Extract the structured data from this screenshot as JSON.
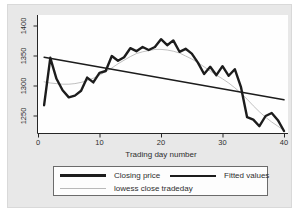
{
  "chart_data": {
    "type": "line",
    "title": "",
    "xlabel": "Trading day number",
    "ylabel": "",
    "xlim": [
      0,
      41
    ],
    "ylim": [
      1221,
      1405
    ],
    "grid": false,
    "legend_position": "bottom",
    "x_tick_values": [
      0,
      10,
      20,
      30,
      40
    ],
    "y_tick_values": [
      1250,
      1300,
      1350,
      1400
    ],
    "x": [
      1,
      2,
      3,
      4,
      5,
      6,
      7,
      8,
      9,
      10,
      11,
      12,
      13,
      14,
      15,
      16,
      17,
      18,
      19,
      20,
      21,
      22,
      23,
      24,
      25,
      26,
      27,
      28,
      29,
      30,
      31,
      32,
      33,
      34,
      35,
      36,
      37,
      38,
      39,
      40
    ],
    "series": [
      {
        "name": "Closing price",
        "style": "thick-solid-black",
        "values": [
          1268,
          1347,
          1312,
          1293,
          1281,
          1284,
          1292,
          1314,
          1306,
          1322,
          1325,
          1350,
          1342,
          1348,
          1363,
          1358,
          1365,
          1360,
          1365,
          1378,
          1368,
          1376,
          1357,
          1362,
          1354,
          1339,
          1320,
          1332,
          1318,
          1333,
          1317,
          1328,
          1298,
          1248,
          1244,
          1233,
          1250,
          1255,
          1243,
          1225
        ]
      },
      {
        "name": "Fitted values",
        "style": "medium-solid-black",
        "x": [
          1,
          40
        ],
        "values": [
          1348,
          1277
        ]
      },
      {
        "name": "lowess close tradeday",
        "style": "thin-solid-gray",
        "values": [
          1307,
          1305,
          1304,
          1303,
          1303,
          1304,
          1306,
          1309,
          1313,
          1318,
          1324,
          1330,
          1337,
          1343,
          1349,
          1354,
          1357,
          1359,
          1361,
          1361,
          1360,
          1358,
          1355,
          1350,
          1345,
          1339,
          1332,
          1325,
          1318,
          1312,
          1305,
          1297,
          1288,
          1278,
          1267,
          1257,
          1248,
          1240,
          1233,
          1226
        ]
      }
    ],
    "colors": {
      "series_black": "#1c1c1c",
      "lowess_gray": "#b9b9b9",
      "graph_background": "#e8e8e8",
      "plot_background": "#fefefe",
      "axis": "#262626",
      "text": "#2e2e2e"
    }
  }
}
